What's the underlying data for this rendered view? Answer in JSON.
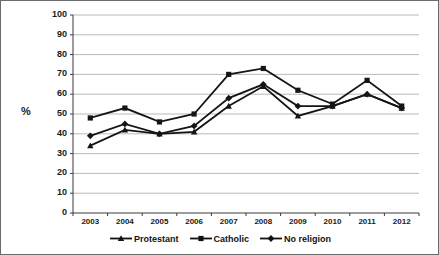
{
  "chart_data": {
    "type": "line",
    "title": "",
    "subtitle": "",
    "xlabel": "",
    "ylabel": "%",
    "categories": [
      "2003",
      "2004",
      "2005",
      "2006",
      "2007",
      "2008",
      "2009",
      "2010",
      "2011",
      "2012"
    ],
    "x": [
      2003,
      2004,
      2005,
      2006,
      2007,
      2008,
      2009,
      2010,
      2011,
      2012
    ],
    "ylim": [
      0,
      100
    ],
    "ytick_step": 10,
    "yticks": [
      0,
      10,
      20,
      30,
      40,
      50,
      60,
      70,
      80,
      90,
      100
    ],
    "ytick_labels": [
      "0",
      "10",
      "20",
      "30",
      "40",
      "50",
      "60",
      "70",
      "80",
      "90",
      "100"
    ],
    "grid": "horizontal",
    "legend_position": "bottom",
    "series": [
      {
        "name": "Protestant",
        "marker": "triangle",
        "color": "#151515",
        "values": [
          34,
          42,
          40,
          41,
          54,
          64,
          49,
          54,
          60,
          53
        ]
      },
      {
        "name": "Catholic",
        "marker": "square",
        "color": "#151515",
        "values": [
          48,
          53,
          46,
          50,
          70,
          73,
          62,
          55,
          67,
          54
        ]
      },
      {
        "name": "No religion",
        "marker": "diamond",
        "color": "#151515",
        "values": [
          39,
          45,
          40,
          44,
          58,
          65,
          54,
          54,
          60,
          53
        ]
      }
    ]
  },
  "axis": {
    "y_title": "%"
  },
  "legend": {
    "items": [
      {
        "label": "Protestant",
        "marker": "triangle-marker-icon"
      },
      {
        "label": "Catholic",
        "marker": "square-marker-icon"
      },
      {
        "label": "No religion",
        "marker": "diamond-marker-icon"
      }
    ]
  }
}
